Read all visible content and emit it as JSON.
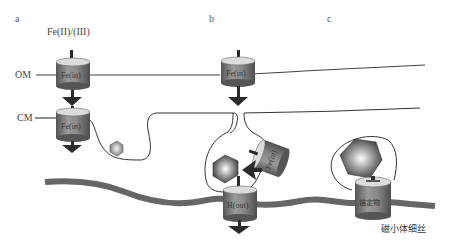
{
  "panels": {
    "a": "a",
    "b": "b",
    "c": "c"
  },
  "labels": {
    "iron_source": "Fe(II)/(III)",
    "outer_membrane": "OM",
    "cytoplasmic_membrane": "CM",
    "transporter_om_a": "Fe(in)",
    "transporter_cm_a": "Fe(in)",
    "transporter_om_b": "Fe(in)",
    "transporter_vesicle_b": "Fe(in)",
    "transporter_out_b": "H(out)",
    "anchor": "锚定物",
    "filament": "磁小体细丝"
  },
  "colors": {
    "transporter_body": "#7a7a7a",
    "transporter_top": "#d8d8d8",
    "filament": "#6b6b6b",
    "membrane_line": "#444444",
    "arrow": "#2b2b2b"
  }
}
